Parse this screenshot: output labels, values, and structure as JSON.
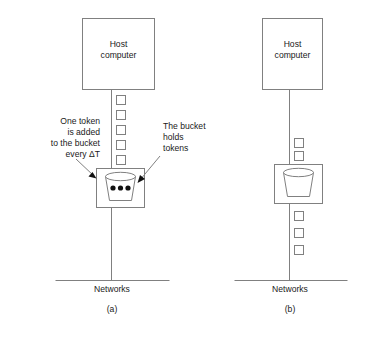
{
  "figure": {
    "title_text": "",
    "colors": {
      "stroke": "#808080",
      "text": "#1a1a1a",
      "dot": "#111111",
      "background": "#ffffff"
    }
  },
  "panels": [
    {
      "id": "a",
      "caption": "(a)",
      "host": {
        "line1": "Host",
        "line2": "computer"
      },
      "network_label": "Networks",
      "tokens_above_bucket": 5,
      "tokens_below_bucket": 0,
      "bucket_dots": 3,
      "annotations": [
        {
          "id": "one-token-added",
          "align": "right",
          "lines": [
            "One token",
            "is added",
            "to the bucket",
            "every ΔT"
          ]
        },
        {
          "id": "bucket-holds-tokens",
          "align": "left",
          "lines": [
            "The bucket",
            "holds",
            "tokens"
          ]
        }
      ]
    },
    {
      "id": "b",
      "caption": "(b)",
      "host": {
        "line1": "Host",
        "line2": "computer"
      },
      "network_label": "Networks",
      "tokens_above_bucket": 2,
      "tokens_below_bucket": 3,
      "bucket_dots": 0,
      "annotations": []
    }
  ]
}
